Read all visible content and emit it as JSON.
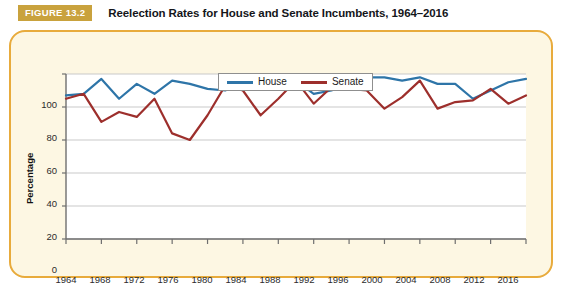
{
  "header": {
    "badge": "FIGURE 13.2",
    "title": "Reelection Rates for House and Senate Incumbents, 1964–2016"
  },
  "colors": {
    "house": "#2e75a8",
    "senate": "#9d2f2c",
    "frame_border": "#e8ab3c",
    "frame_fill": "#fdf7e3",
    "badge_bg": "#c9a23d",
    "gridline": "#c9c9c9",
    "axis": "#6f6f6f",
    "plot_bg": "#ffffff"
  },
  "chart_data": {
    "type": "line",
    "title": "Reelection Rates for House and Senate Incumbents, 1964–2016",
    "xlabel": "Year",
    "ylabel": "Percentage",
    "xlim": [
      1964,
      2016
    ],
    "ylim": [
      0,
      100
    ],
    "grid": true,
    "legend_position": "top-center",
    "xticks": [
      1964,
      1968,
      1972,
      1976,
      1980,
      1984,
      1988,
      1992,
      1996,
      2000,
      2004,
      2008,
      2012,
      2016
    ],
    "yticks": [
      0,
      20,
      40,
      60,
      80,
      100
    ],
    "x": [
      1964,
      1966,
      1968,
      1970,
      1972,
      1974,
      1976,
      1978,
      1980,
      1982,
      1984,
      1986,
      1988,
      1990,
      1992,
      1994,
      1996,
      1998,
      2000,
      2002,
      2004,
      2006,
      2008,
      2010,
      2012,
      2014,
      2016
    ],
    "series": [
      {
        "name": "House",
        "color": "#2e75a8",
        "values": [
          87,
          88,
          97,
          85,
          94,
          88,
          96,
          94,
          91,
          90,
          95,
          98,
          98,
          96,
          88,
          90,
          94,
          98,
          98,
          96,
          98,
          94,
          94,
          85,
          90,
          95,
          97
        ]
      },
      {
        "name": "Senate",
        "color": "#9d2f2c",
        "values": [
          85,
          88,
          71,
          77,
          74,
          85,
          64,
          60,
          75,
          93,
          90,
          75,
          85,
          96,
          82,
          92,
          91,
          90,
          79,
          86,
          96,
          79,
          83,
          84,
          91,
          82,
          87
        ]
      }
    ]
  }
}
